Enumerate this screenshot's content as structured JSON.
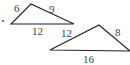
{
  "figure": {
    "triangles": [
      {
        "name": "small-triangle",
        "sides": {
          "left": "6",
          "right": "9",
          "base": "12"
        }
      },
      {
        "name": "large-triangle",
        "sides": {
          "left": "12",
          "right": "8",
          "base": "16"
        }
      }
    ],
    "bullet": "."
  }
}
